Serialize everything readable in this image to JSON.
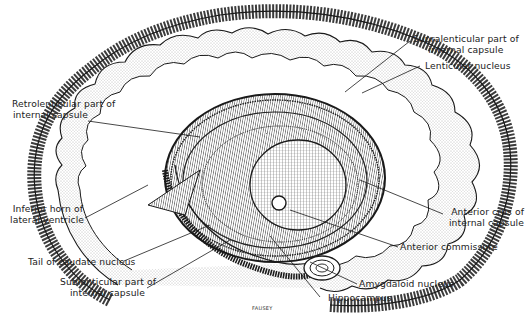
{
  "figure": {
    "artist_signature": "FAUSEY",
    "colors": {
      "ink": "#1a1a1a",
      "background": "#ffffff",
      "stipple": "#9a9a9a"
    }
  },
  "labels": {
    "supralenticular": [
      "Supralenticular part of",
      "internal capsule"
    ],
    "lenticular": "Lenticular nucleus",
    "retrolenticular": [
      "Retrolenticular part of",
      "internal capsule"
    ],
    "inferior_horn": [
      "Inferior horn of",
      "lateral ventricle"
    ],
    "anterior_crus": [
      "Anterior crus of",
      "internal capsule"
    ],
    "anterior_commissure": "Anterior commissure",
    "tail_caudate": "Tail of caudate nucleus",
    "sublenticular": [
      "Sublenticular part of",
      "internal capsule"
    ],
    "amygdaloid": "Amygdaloid nucleus",
    "hippocampus": "Hippocampus"
  }
}
